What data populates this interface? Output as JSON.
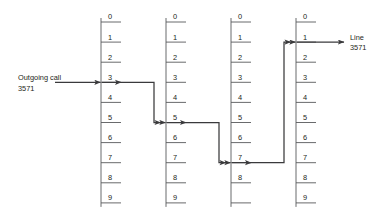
{
  "figure": {
    "type": "diagram",
    "width": 385,
    "height": 215,
    "background_color": "#ffffff",
    "line_color": "#58595b",
    "path_color": "#3a3a3c",
    "text_color": "#231f20"
  },
  "input": {
    "label_line1": "Outgoing call",
    "label_line2": "3571",
    "enters_stage": 1,
    "enters_at_digit": "3"
  },
  "output": {
    "label_line1": "Line",
    "label_line2": "3571",
    "exits_stage": 4,
    "exits_at_digit": "1"
  },
  "stages": [
    {
      "index": 1,
      "name": "first-selector",
      "x": 101,
      "digits": [
        "0",
        "1",
        "2",
        "3",
        "4",
        "5",
        "6",
        "7",
        "8",
        "9"
      ],
      "selected_digit": "3",
      "selected_index": 3
    },
    {
      "index": 2,
      "name": "second-selector",
      "x": 166,
      "digits": [
        "0",
        "1",
        "2",
        "3",
        "4",
        "5",
        "6",
        "7",
        "8",
        "9"
      ],
      "selected_digit": "5",
      "selected_index": 5
    },
    {
      "index": 3,
      "name": "third-selector",
      "x": 231,
      "digits": [
        "0",
        "1",
        "2",
        "3",
        "4",
        "5",
        "6",
        "7",
        "8",
        ""
      ],
      "selected_digit": "7",
      "selected_index": 7
    },
    {
      "index": 4,
      "name": "connector",
      "x": 296,
      "digits": [
        "0",
        "1",
        "2",
        "3",
        "4",
        "5",
        "6",
        "7",
        "8",
        "9"
      ],
      "selected_digit": "1",
      "selected_index": 1
    }
  ],
  "geometry": {
    "top_tick_y": 22,
    "tick_spacing": 20.1,
    "tick_length": 20,
    "rail_extra_top": 4,
    "rail_extra_bottom": 4
  },
  "chart_data": {
    "type": "diagram",
    "path_digits": [
      "3",
      "5",
      "7",
      "1"
    ],
    "annotations": [
      "Outgoing call 3571",
      "Line 3571"
    ]
  }
}
